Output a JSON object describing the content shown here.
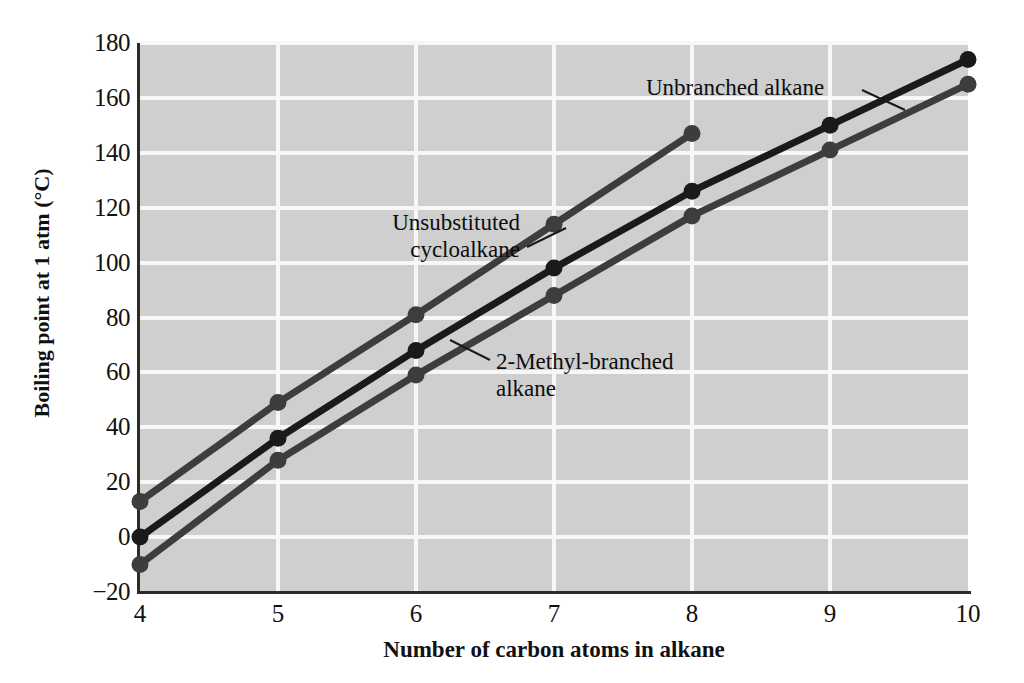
{
  "chart_data": {
    "type": "line",
    "title": "",
    "xlabel": "Number of carbon atoms in alkane",
    "ylabel": "Boiling point at 1 atm (°C)",
    "xlim": [
      4,
      10
    ],
    "ylim": [
      -20,
      180
    ],
    "xticks": [
      4,
      5,
      6,
      7,
      8,
      9,
      10
    ],
    "yticks": [
      -20,
      0,
      20,
      40,
      60,
      80,
      100,
      120,
      140,
      160,
      180
    ],
    "xtick_labels": [
      "4",
      "5",
      "6",
      "7",
      "8",
      "9",
      "10"
    ],
    "ytick_labels": [
      "−20",
      "0",
      "20",
      "40",
      "60",
      "80",
      "100",
      "120",
      "140",
      "160",
      "180"
    ],
    "grid": true,
    "grid_color": "#f7f7f7",
    "plot_background": "#cfcfcf",
    "legend_position": "inline-annotations",
    "markers": "filled-circle",
    "series": [
      {
        "name": "Unsubstituted cycloalkane",
        "color": "#3d3d3d",
        "x": [
          4,
          5,
          6,
          7,
          8
        ],
        "values": [
          13,
          49,
          81,
          114,
          147
        ]
      },
      {
        "name": "Unbranched alkane",
        "color": "#1a1a1a",
        "x": [
          4,
          5,
          6,
          7,
          8,
          9,
          10
        ],
        "values": [
          0,
          36,
          68,
          98,
          126,
          150,
          174
        ]
      },
      {
        "name": "2-Methyl-branched alkane",
        "color": "#3d3d3d",
        "x": [
          4,
          5,
          6,
          7,
          8,
          9,
          10
        ],
        "values": [
          -10,
          28,
          59,
          88,
          117,
          141,
          165
        ]
      }
    ],
    "annotations": [
      {
        "name": "unbranched-alkane",
        "text": "Unbranched alkane",
        "series": "Unbranched alkane"
      },
      {
        "name": "unsubstituted-cycloalkane",
        "text": "Unsubstituted\ncycloalkane",
        "series": "Unsubstituted cycloalkane"
      },
      {
        "name": "2-methyl-branched-alkane",
        "text": "2-Methyl-branched\nalkane",
        "series": "2-Methyl-branched alkane"
      }
    ]
  }
}
